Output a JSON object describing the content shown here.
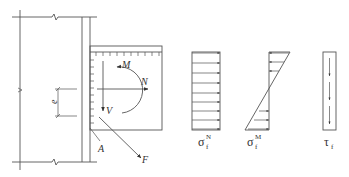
{
  "figure": {
    "type": "structural-connection-diagram"
  },
  "labels": {
    "moment": "M",
    "axial": "N",
    "shear": "V",
    "force": "F",
    "point": "A",
    "eccentricity": "e"
  },
  "stress_diagrams": [
    {
      "id": "sigma-N",
      "symbol": "σ",
      "subscript": "f",
      "superscript": "N",
      "kind": "uniform-normal"
    },
    {
      "id": "sigma-M",
      "symbol": "σ",
      "subscript": "f",
      "superscript": "M",
      "kind": "linear-bending"
    },
    {
      "id": "tau",
      "symbol": "τ",
      "subscript": "f",
      "superscript": "",
      "kind": "uniform-shear"
    }
  ],
  "colors": {
    "line": "#555555",
    "text": "#333333",
    "background": "#ffffff"
  }
}
